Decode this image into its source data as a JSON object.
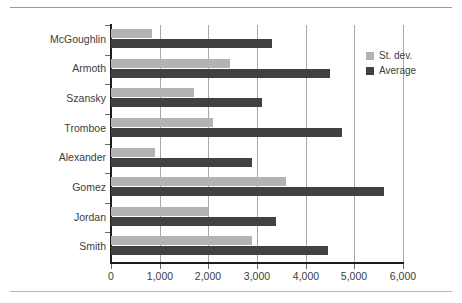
{
  "figure": {
    "rules": {
      "top": true,
      "bottom": true
    }
  },
  "legend": {
    "position": "right",
    "entries": [
      {
        "label": "St. dev.",
        "color": "#b3b3b3",
        "name": "legend-item-st-dev"
      },
      {
        "label": "Average",
        "color": "#414141",
        "name": "legend-item-average"
      }
    ]
  },
  "axis": {
    "x_ticks": [
      "0",
      "1,000",
      "2,000",
      "3,000",
      "4,000",
      "5,000",
      "6,000"
    ],
    "x_tick_values": [
      0,
      1000,
      2000,
      3000,
      4000,
      5000,
      6000
    ]
  },
  "chart_data": {
    "type": "bar",
    "orientation": "horizontal",
    "title": "",
    "xlabel": "",
    "ylabel": "",
    "categories": [
      "McGoughlin",
      "Armoth",
      "Szansky",
      "Tromboe",
      "Alexander",
      "Gomez",
      "Jordan",
      "Smith"
    ],
    "series": [
      {
        "name": "St. dev.",
        "color": "#b3b3b3",
        "values": [
          850,
          2450,
          1700,
          2100,
          900,
          3600,
          2000,
          2900
        ]
      },
      {
        "name": "Average",
        "color": "#414141",
        "values": [
          3300,
          4500,
          3100,
          4750,
          2900,
          5600,
          3400,
          4450
        ]
      }
    ],
    "xlim": [
      0,
      6400
    ],
    "xticks": [
      0,
      1000,
      2000,
      3000,
      4000,
      5000,
      6000
    ],
    "grid": "vertical",
    "legend_position": "right"
  }
}
